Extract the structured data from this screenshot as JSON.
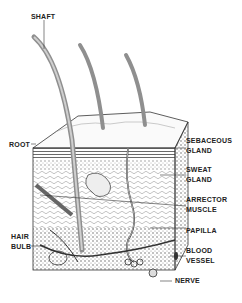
{
  "diagram": {
    "labels": {
      "shaft": "SHAFT",
      "root": "ROOT",
      "hair_bulb_1": "HAIR",
      "hair_bulb_2": "BULB",
      "sebaceous_1": "SEBACEOUS",
      "sebaceous_2": "GLAND",
      "sweat_1": "SWEAT",
      "sweat_2": "GLAND",
      "arrector_1": "ARRECTOR",
      "arrector_2": "MUSCLE",
      "papilla": "PAPILLA",
      "blood_1": "BLOOD",
      "blood_2": "VESSEL",
      "nerve": "NERVE"
    },
    "colors": {
      "ink": "#222222",
      "hair": "#9a9a9a",
      "background": "#ffffff"
    }
  }
}
